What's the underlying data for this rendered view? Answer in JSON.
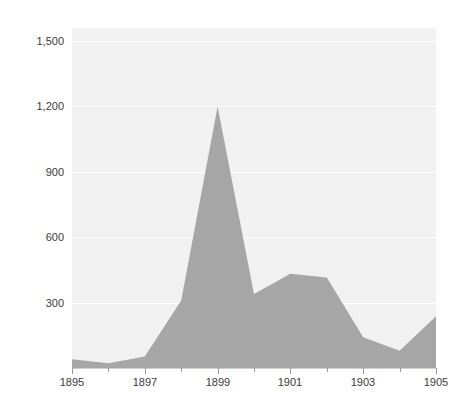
{
  "chart_data": {
    "type": "area",
    "title": "",
    "subtitle": "",
    "xlabel": "",
    "ylabel": "Number of mergers",
    "x": [
      1895,
      1896,
      1897,
      1898,
      1899,
      1900,
      1901,
      1902,
      1903,
      1904,
      1905
    ],
    "values": [
      40,
      22,
      53,
      310,
      1200,
      340,
      432,
      415,
      141,
      79,
      238
    ],
    "series": [
      {
        "name": "Number of mergers",
        "values": [
          40,
          22,
          53,
          310,
          1200,
          340,
          432,
          415,
          141,
          79,
          238
        ]
      }
    ],
    "xlim": [
      1895,
      1905
    ],
    "ylim": [
      0,
      1560
    ],
    "y_ticks": [
      300,
      600,
      900,
      1200,
      1500
    ],
    "y_tick_labels": [
      "300",
      "600",
      "900",
      "1,200",
      "1,500"
    ],
    "x_ticks": [
      1895,
      1897,
      1899,
      1901,
      1903,
      1905
    ],
    "x_tick_labels": [
      "1895",
      "1897",
      "1899",
      "1901",
      "1903",
      "1905"
    ],
    "x_minor_ticks": [
      1896,
      1898,
      1900,
      1902,
      1904
    ],
    "grid": "horizontal",
    "legend": "none",
    "colors": {
      "area_fill": "#a6a6a6",
      "plot_background": "#f1f1f1",
      "gridline": "#ffffff",
      "axis_text": "#3a3a3a",
      "page_background": "#ffffff"
    }
  }
}
